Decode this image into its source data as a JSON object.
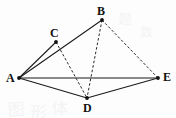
{
  "figure": {
    "canvas": {
      "width": 176,
      "height": 118
    },
    "background_color": "#fdfdfd",
    "line_color": "#1a1a1a",
    "vertices": [
      {
        "id": "A",
        "label": "A",
        "x": 19,
        "y": 78,
        "label_x": 6,
        "label_y": 72
      },
      {
        "id": "B",
        "label": "B",
        "x": 102,
        "y": 20,
        "label_x": 97,
        "label_y": 5
      },
      {
        "id": "C",
        "label": "C",
        "x": 56,
        "y": 42,
        "label_x": 50,
        "label_y": 27
      },
      {
        "id": "D",
        "label": "D",
        "x": 87,
        "y": 98,
        "label_x": 83,
        "label_y": 102
      },
      {
        "id": "E",
        "label": "E",
        "x": 158,
        "y": 78,
        "label_x": 163,
        "label_y": 71
      }
    ],
    "edges": [
      {
        "from": "A",
        "to": "B",
        "style": "solid",
        "name": "edge-a-b"
      },
      {
        "from": "A",
        "to": "C",
        "style": "solid",
        "name": "edge-a-c"
      },
      {
        "from": "A",
        "to": "D",
        "style": "solid",
        "name": "edge-a-d"
      },
      {
        "from": "A",
        "to": "E",
        "style": "solid",
        "name": "edge-a-e"
      },
      {
        "from": "D",
        "to": "E",
        "style": "solid",
        "name": "edge-d-e"
      },
      {
        "from": "B",
        "to": "D",
        "style": "dashed",
        "name": "edge-b-d"
      },
      {
        "from": "B",
        "to": "E",
        "style": "dashed",
        "name": "edge-b-e"
      },
      {
        "from": "C",
        "to": "D",
        "style": "dashed",
        "name": "edge-c-d"
      }
    ],
    "watermarks": [
      {
        "text": "图",
        "x": 8,
        "y": 96,
        "size": 17,
        "rotate": -3
      },
      {
        "text": "形",
        "x": 30,
        "y": 98,
        "size": 17,
        "rotate": 2
      },
      {
        "text": "体",
        "x": 52,
        "y": 95,
        "size": 16,
        "rotate": -1
      },
      {
        "text": "题",
        "x": 118,
        "y": 8,
        "size": 14,
        "rotate": 2
      },
      {
        "text": "数",
        "x": 140,
        "y": 22,
        "size": 13,
        "rotate": -2
      }
    ]
  }
}
